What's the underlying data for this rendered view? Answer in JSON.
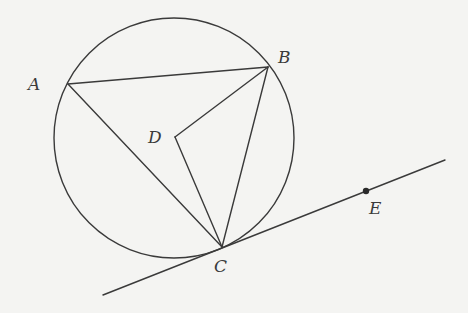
{
  "diagram": {
    "type": "geometry-circle-tangent",
    "colors": {
      "background": "#f4f4f2",
      "stroke": "#3a3a3a"
    },
    "circle": {
      "cx": 174,
      "cy": 138,
      "r": 120
    },
    "points": {
      "A": {
        "label": "A",
        "x": 68,
        "y": 84,
        "label_x": 28,
        "label_y": 90
      },
      "B": {
        "label": "B",
        "x": 268,
        "y": 67,
        "label_x": 278,
        "label_y": 63
      },
      "C": {
        "label": "C",
        "x": 222,
        "y": 247,
        "label_x": 214,
        "label_y": 272
      },
      "D": {
        "label": "D",
        "x": 175,
        "y": 137,
        "label_x": 148,
        "label_y": 143
      },
      "E": {
        "label": "E",
        "x": 366,
        "y": 191,
        "label_x": 369,
        "label_y": 214
      }
    },
    "segments": [
      {
        "name": "AB",
        "from": "A",
        "to": "B"
      },
      {
        "name": "AC",
        "from": "A",
        "to": "C"
      },
      {
        "name": "BC",
        "from": "B",
        "to": "C"
      },
      {
        "name": "BD",
        "from": "B",
        "to": "D"
      },
      {
        "name": "DC",
        "from": "D",
        "to": "C"
      }
    ],
    "tangent_line": {
      "x1": 103,
      "y1": 295,
      "x2": 445,
      "y2": 160,
      "through": [
        "C",
        "E"
      ]
    }
  }
}
